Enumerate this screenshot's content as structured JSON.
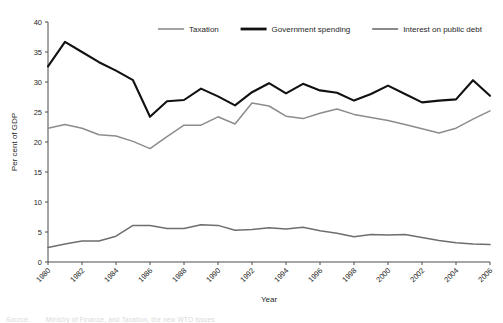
{
  "figure": {
    "background": "#ffffff",
    "source_label": "Source:",
    "source_text": "Ministry of Finance, and Taxation, the new WTO issues"
  },
  "axes": {
    "y_title": "Per cent of GDP",
    "x_title": "Year",
    "y_ticks": [
      0,
      5,
      10,
      15,
      20,
      25,
      30,
      35,
      40
    ],
    "x_ticks": [
      "1980",
      "1982",
      "1984",
      "1986",
      "1988",
      "1990",
      "1992",
      "1994",
      "1996",
      "1998",
      "2000",
      "2002",
      "2004",
      "2006"
    ],
    "axis_color": "#4d4d4d"
  },
  "legend": {
    "position": "top",
    "entries": [
      {
        "label": "Taxation",
        "color": "#8c8c8c",
        "width": 1.6
      },
      {
        "label": "Government spending",
        "color": "#111111",
        "width": 2.2
      },
      {
        "label": "Interest on public debt",
        "color": "#6e6e6e",
        "width": 1.6
      }
    ]
  },
  "chart_data": {
    "type": "line",
    "title": "",
    "xlabel": "Year",
    "ylabel": "Per cent of GDP",
    "xlim": [
      1980,
      2006
    ],
    "ylim": [
      0,
      40
    ],
    "grid": false,
    "legend_position": "top",
    "x": [
      1980,
      1981,
      1982,
      1983,
      1984,
      1985,
      1986,
      1987,
      1988,
      1989,
      1990,
      1991,
      1992,
      1993,
      1994,
      1995,
      1996,
      1997,
      1998,
      1999,
      2000,
      2001,
      2002,
      2003,
      2004,
      2005,
      2006
    ],
    "series": [
      {
        "name": "Taxation",
        "color": "#8c8c8c",
        "values": [
          22.3,
          22.9,
          22.3,
          21.2,
          21.0,
          20.1,
          18.9,
          20.9,
          22.8,
          22.8,
          24.2,
          23.0,
          26.5,
          26.0,
          24.3,
          23.9,
          24.8,
          25.5,
          24.6,
          24.1,
          23.6,
          22.9,
          22.2,
          21.5,
          22.3,
          23.8,
          25.2
        ]
      },
      {
        "name": "Government spending",
        "color": "#111111",
        "values": [
          32.6,
          36.7,
          35.0,
          33.3,
          31.9,
          30.3,
          24.2,
          26.8,
          27.0,
          28.9,
          27.6,
          26.1,
          28.3,
          29.8,
          28.1,
          29.7,
          28.6,
          28.2,
          26.9,
          28.0,
          29.4,
          28.0,
          26.6,
          26.9,
          27.1,
          30.3,
          27.7
        ]
      },
      {
        "name": "Interest on public debt",
        "color": "#6e6e6e",
        "values": [
          2.4,
          3.0,
          3.5,
          3.5,
          4.3,
          6.1,
          6.1,
          5.6,
          5.6,
          6.2,
          6.1,
          5.3,
          5.4,
          5.7,
          5.5,
          5.8,
          5.2,
          4.8,
          4.2,
          4.6,
          4.5,
          4.6,
          4.1,
          3.6,
          3.2,
          3.0,
          2.9
        ]
      }
    ]
  }
}
